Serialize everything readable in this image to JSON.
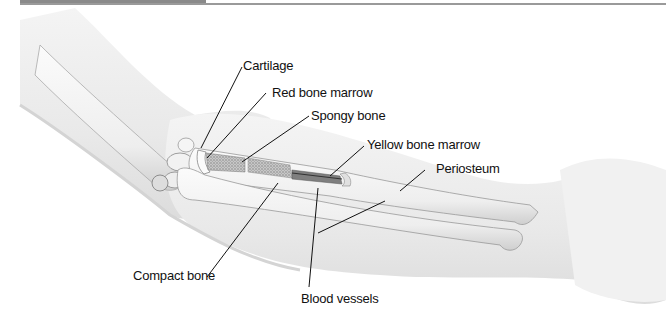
{
  "figure": {
    "labels": [
      {
        "id": "cartilage",
        "text": "Cartilage"
      },
      {
        "id": "red-bone-marrow",
        "text": "Red bone marrow"
      },
      {
        "id": "spongy-bone",
        "text": "Spongy bone"
      },
      {
        "id": "yellow-bone-marrow",
        "text": "Yellow bone marrow"
      },
      {
        "id": "periosteum",
        "text": "Periosteum"
      },
      {
        "id": "compact-bone",
        "text": "Compact bone"
      },
      {
        "id": "blood-vessels",
        "text": "Blood vessels"
      }
    ]
  },
  "colors": {
    "skin": "#efefef",
    "skin_shadow": "#d6d6d6",
    "bone": "#f7f7f7",
    "bone_outline": "#9a9a9a",
    "marrow_stipple": "#8c8c8c",
    "leader_line": "#111111",
    "header_bar": "#8a8a8a"
  }
}
